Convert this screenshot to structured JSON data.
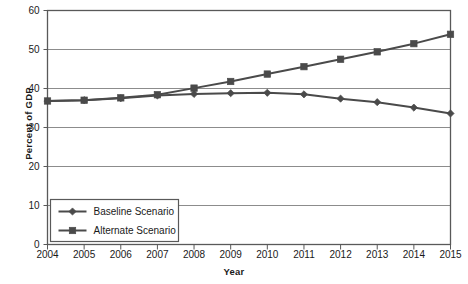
{
  "chart_data": {
    "type": "line",
    "title": "",
    "xlabel": "Year",
    "ylabel": "Percent of GDP",
    "x": [
      2004,
      2005,
      2006,
      2007,
      2008,
      2009,
      2010,
      2011,
      2012,
      2013,
      2014,
      2015
    ],
    "categories": [
      "2004",
      "2005",
      "2006",
      "2007",
      "2008",
      "2009",
      "2010",
      "2011",
      "2012",
      "2013",
      "2014",
      "2015"
    ],
    "xlim": [
      2004,
      2015
    ],
    "ylim": [
      0,
      60
    ],
    "yticks": [
      0,
      10,
      20,
      30,
      40,
      50,
      60
    ],
    "ytick_labels": [
      "0",
      "10",
      "20",
      "30",
      "40",
      "50",
      "60"
    ],
    "grid": "horizontal",
    "legend_position": "bottom-left",
    "series": [
      {
        "name": "Baseline Scenario",
        "marker": "diamond",
        "color": "#4a4a4a",
        "values": [
          36.8,
          37.0,
          37.5,
          38.2,
          38.6,
          38.8,
          38.9,
          38.5,
          37.4,
          36.5,
          35.1,
          33.6
        ]
      },
      {
        "name": "Alternate Scenario",
        "marker": "square",
        "color": "#4a4a4a",
        "values": [
          36.8,
          37.0,
          37.6,
          38.4,
          40.1,
          41.8,
          43.7,
          45.6,
          47.5,
          49.4,
          51.5,
          53.9
        ]
      }
    ]
  },
  "legend": {
    "items": [
      {
        "label": "Baseline Scenario",
        "marker": "diamond"
      },
      {
        "label": "Alternate Scenario",
        "marker": "square"
      }
    ]
  },
  "axes": {
    "y_title": "Percent of GDP",
    "x_title": "Year"
  },
  "style": {
    "line_color": "#4a4a4a",
    "grid_color": "#8c8c8c",
    "frame_color": "#595959",
    "background": "#ffffff"
  }
}
